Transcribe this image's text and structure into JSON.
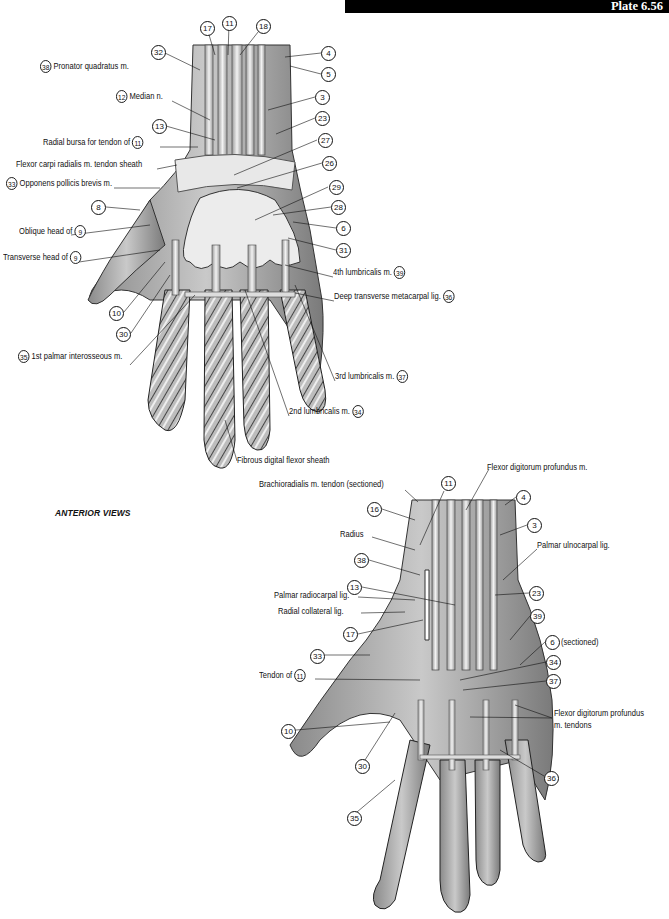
{
  "header": {
    "plate": "Plate 6.56"
  },
  "section_label": "ANTERIOR VIEWS",
  "figure_top": {
    "callouts_numbers": [
      {
        "n": "17",
        "x": 200,
        "y": 21
      },
      {
        "n": "11",
        "x": 222,
        "y": 16
      },
      {
        "n": "18",
        "x": 256,
        "y": 19
      },
      {
        "n": "32",
        "x": 151,
        "y": 45
      },
      {
        "n": "4",
        "x": 321,
        "y": 46
      },
      {
        "n": "5",
        "x": 321,
        "y": 67
      },
      {
        "n": "3",
        "x": 315,
        "y": 90
      },
      {
        "n": "23",
        "x": 315,
        "y": 111
      },
      {
        "n": "13",
        "x": 152,
        "y": 119
      },
      {
        "n": "27",
        "x": 318,
        "y": 133
      },
      {
        "n": "26",
        "x": 322,
        "y": 156
      },
      {
        "n": "8",
        "x": 91,
        "y": 200
      },
      {
        "n": "29",
        "x": 329,
        "y": 180
      },
      {
        "n": "28",
        "x": 331,
        "y": 200
      },
      {
        "n": "6",
        "x": 336,
        "y": 221
      },
      {
        "n": "31",
        "x": 336,
        "y": 243
      },
      {
        "n": "10",
        "x": 109,
        "y": 306
      },
      {
        "n": "30",
        "x": 116,
        "y": 327
      }
    ],
    "labels": [
      {
        "text": "Pronator quadratus m.",
        "num": "38",
        "num_first": true,
        "x": 40,
        "y": 65
      },
      {
        "text": "Median n.",
        "num": "12",
        "num_first": true,
        "x": 116,
        "y": 95
      },
      {
        "text": "Radial bursa for tendon of",
        "num": "11",
        "num_first": false,
        "x": 43,
        "y": 141
      },
      {
        "text": "Flexor carpi radialis m. tendon sheath",
        "num": "",
        "num_first": false,
        "x": 16,
        "y": 163
      },
      {
        "text": "Opponens pollicis brevis m.",
        "num": "33",
        "num_first": true,
        "x": 6,
        "y": 182
      },
      {
        "text": "Oblique head of",
        "num": "9",
        "num_first": false,
        "x": 19,
        "y": 230
      },
      {
        "text": "Transverse head of",
        "num": "9",
        "num_first": false,
        "x": 3,
        "y": 256
      },
      {
        "text": "4th lumbricalis m.",
        "num": "39",
        "num_first": false,
        "x": 333,
        "y": 271
      },
      {
        "text": "Deep transverse metacarpal lig.",
        "num": "36",
        "num_first": false,
        "x": 334,
        "y": 295
      },
      {
        "text": "1st palmar interosseous m.",
        "num": "35",
        "num_first": true,
        "x": 18,
        "y": 355
      },
      {
        "text": "3rd lumbricalis m.",
        "num": "37",
        "num_first": false,
        "x": 335,
        "y": 375
      },
      {
        "text": "2nd lumbricalis m.",
        "num": "34",
        "num_first": false,
        "x": 289,
        "y": 410
      },
      {
        "text": "Fibrous digital flexor sheath",
        "num": "",
        "num_first": false,
        "x": 237,
        "y": 455
      }
    ]
  },
  "figure_bottom": {
    "callouts_numbers": [
      {
        "n": "11",
        "x": 441,
        "y": 476
      },
      {
        "n": "4",
        "x": 516,
        "y": 490
      },
      {
        "n": "16",
        "x": 367,
        "y": 502
      },
      {
        "n": "3",
        "x": 527,
        "y": 518
      },
      {
        "n": "38",
        "x": 354,
        "y": 553
      },
      {
        "n": "13",
        "x": 347,
        "y": 580
      },
      {
        "n": "23",
        "x": 529,
        "y": 586
      },
      {
        "n": "39",
        "x": 530,
        "y": 609
      },
      {
        "n": "17",
        "x": 343,
        "y": 627
      },
      {
        "n": "6",
        "x": 545,
        "y": 635
      },
      {
        "n": "33",
        "x": 310,
        "y": 649
      },
      {
        "n": "34",
        "x": 546,
        "y": 655
      },
      {
        "n": "37",
        "x": 546,
        "y": 674
      },
      {
        "n": "10",
        "x": 281,
        "y": 724
      },
      {
        "n": "30",
        "x": 355,
        "y": 759
      },
      {
        "n": "36",
        "x": 544,
        "y": 771
      },
      {
        "n": "35",
        "x": 347,
        "y": 811
      }
    ],
    "labels": [
      {
        "text": "Flexor digitorum profundus m.",
        "num": "",
        "num_first": false,
        "x": 487,
        "y": 466
      },
      {
        "text": "Brachioradialis m. tendon (sectioned)",
        "num": "",
        "num_first": false,
        "x": 259,
        "y": 483
      },
      {
        "text": "Radius",
        "num": "",
        "num_first": false,
        "x": 340,
        "y": 533
      },
      {
        "text": "Palmar ulnocarpal lig.",
        "num": "",
        "num_first": false,
        "x": 537,
        "y": 544
      },
      {
        "text": "Palmar radiocarpal lig.",
        "num": "",
        "num_first": false,
        "x": 274,
        "y": 594
      },
      {
        "text": "Radial collateral lig.",
        "num": "",
        "num_first": false,
        "x": 278,
        "y": 610
      },
      {
        "text": "(sectioned)",
        "num": "",
        "num_first": false,
        "x": 561,
        "y": 637
      },
      {
        "text": "Tendon of",
        "num": "11",
        "num_first": false,
        "x": 259,
        "y": 673
      },
      {
        "text": "Flexor digitorum profundus",
        "num": "",
        "num_first": false,
        "x": 554,
        "y": 712
      },
      {
        "text": "m. tendons",
        "num": "",
        "num_first": false,
        "x": 554,
        "y": 724
      }
    ]
  }
}
